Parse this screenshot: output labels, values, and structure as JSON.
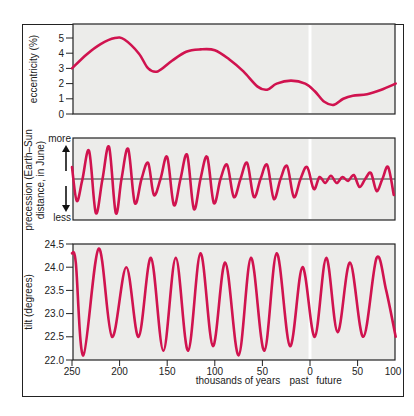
{
  "chart_data": [
    {
      "type": "line",
      "title": "",
      "ylabel": "eccentricity (%)",
      "xlabel": "thousands of years",
      "ylim": [
        0,
        5.5
      ],
      "yticks": [
        "0",
        "1",
        "2",
        "3",
        "4",
        "5"
      ],
      "x": [
        -250,
        -235,
        -220,
        -205,
        -195,
        -180,
        -170,
        -160,
        -145,
        -130,
        -115,
        -100,
        -85,
        -70,
        -55,
        -45,
        -35,
        -20,
        -5,
        5,
        15,
        25,
        35,
        45,
        60,
        75,
        90
      ],
      "values": [
        3.0,
        3.9,
        4.6,
        5.0,
        4.9,
        4.0,
        3.0,
        2.8,
        3.5,
        4.1,
        4.25,
        4.2,
        3.6,
        2.8,
        1.8,
        1.6,
        2.0,
        2.2,
        2.0,
        1.5,
        0.8,
        0.6,
        1.0,
        1.2,
        1.3,
        1.6,
        2.0
      ]
    },
    {
      "type": "line",
      "title": "",
      "ylabel": "precession (Earth–Sun distance, in June)",
      "ylabel_top": "more",
      "ylabel_bottom": "less",
      "xlabel": "thousands of years",
      "ylim": [
        -1,
        1
      ],
      "x": [
        -250,
        -245,
        -239,
        -232,
        -225,
        -218,
        -211,
        -204,
        -198,
        -191,
        -184,
        -177,
        -170,
        -164,
        -157,
        -150,
        -143,
        -136,
        -129,
        -122,
        -115,
        -108,
        -101,
        -94,
        -87,
        -80,
        -73,
        -66,
        -59,
        -52,
        -45,
        -38,
        -31,
        -24,
        -17,
        -10,
        -3,
        4,
        10,
        16,
        22,
        28,
        34,
        40,
        46,
        52,
        58,
        64,
        70,
        76,
        82,
        88
      ],
      "values": [
        0.3,
        -0.55,
        0.0,
        0.7,
        -0.85,
        0.0,
        0.8,
        -0.85,
        0.0,
        0.75,
        -0.6,
        0.0,
        0.4,
        -0.4,
        0.0,
        0.55,
        -0.65,
        0.0,
        0.6,
        -0.75,
        0.0,
        0.55,
        -0.6,
        0.0,
        0.35,
        -0.45,
        0.0,
        0.4,
        -0.45,
        0.0,
        0.35,
        -0.5,
        0.0,
        0.32,
        -0.45,
        0.0,
        0.3,
        -0.25,
        0.05,
        -0.1,
        0.08,
        -0.1,
        0.05,
        -0.05,
        0.1,
        -0.2,
        0.0,
        0.15,
        -0.3,
        0.0,
        0.3,
        -0.4
      ]
    },
    {
      "type": "line",
      "title": "",
      "ylabel": "tilt (degrees)",
      "xlabel": "thousands of years",
      "ylim": [
        22.0,
        24.5
      ],
      "yticks": [
        "22.0",
        "22.5",
        "23.0",
        "23.5",
        "24.0",
        "24.5"
      ],
      "x": [
        -250,
        -246,
        -238,
        -222,
        -208,
        -193,
        -180,
        -167,
        -154,
        -141,
        -128,
        -115,
        -102,
        -89,
        -75,
        -62,
        -48,
        -35,
        -21,
        -8,
        5,
        17,
        29,
        42,
        56,
        70,
        80,
        90
      ],
      "values": [
        24.3,
        24.1,
        22.1,
        24.4,
        22.5,
        24.0,
        22.5,
        24.2,
        22.2,
        24.2,
        22.2,
        24.3,
        22.3,
        24.1,
        22.1,
        24.2,
        22.2,
        24.3,
        22.3,
        24.0,
        22.5,
        24.2,
        22.6,
        24.1,
        22.5,
        24.2,
        23.5,
        22.5
      ]
    }
  ],
  "axis": {
    "xticks": [
      "250",
      "200",
      "150",
      "100",
      "50",
      "0",
      "50",
      "100"
    ],
    "xlabel": "thousands of years",
    "past_label": "past",
    "future_label": "future"
  },
  "colors": {
    "curve": "#d0134f",
    "plot_bg": "#ececea",
    "axis": "#222222",
    "present_line": "#ffffff"
  },
  "labels": {
    "ecc": "eccentricity (%)",
    "prec_line1": "precession (Earth–Sun",
    "prec_line2": "distance, in June)",
    "more": "more",
    "less": "less",
    "tilt": "tilt (degrees)"
  }
}
